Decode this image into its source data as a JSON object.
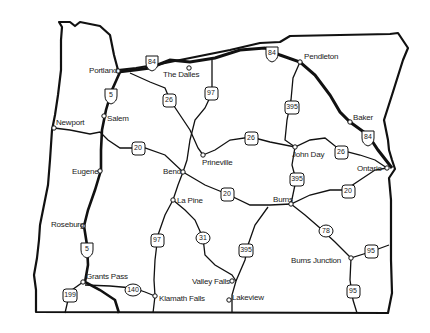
{
  "map": {
    "region": "Oregon",
    "cities": [
      {
        "name": "Portland",
        "x": 118,
        "y": 71
      },
      {
        "name": "The Dalles",
        "x": 189,
        "y": 68
      },
      {
        "name": "Pendleton",
        "x": 300,
        "y": 62
      },
      {
        "name": "Salem",
        "x": 104,
        "y": 116
      },
      {
        "name": "Newport",
        "x": 54,
        "y": 127
      },
      {
        "name": "Baker",
        "x": 350,
        "y": 122
      },
      {
        "name": "Prineville",
        "x": 203,
        "y": 155
      },
      {
        "name": "John Day",
        "x": 295,
        "y": 147
      },
      {
        "name": "Ontario",
        "x": 387,
        "y": 168
      },
      {
        "name": "Eugene",
        "x": 100,
        "y": 171
      },
      {
        "name": "Bend",
        "x": 183,
        "y": 172
      },
      {
        "name": "Burns",
        "x": 291,
        "y": 204
      },
      {
        "name": "La Pine",
        "x": 173,
        "y": 200
      },
      {
        "name": "Roseburg",
        "x": 83,
        "y": 226
      },
      {
        "name": "Burns Junction",
        "x": 351,
        "y": 258
      },
      {
        "name": "Valley Falls",
        "x": 232,
        "y": 281
      },
      {
        "name": "Grants Pass",
        "x": 83,
        "y": 282
      },
      {
        "name": "Klamath Falls",
        "x": 155,
        "y": 296
      },
      {
        "name": "Lakeview",
        "x": 229,
        "y": 300
      }
    ],
    "shields": [
      {
        "route": "84",
        "x": 152,
        "y": 62
      },
      {
        "route": "84",
        "x": 272,
        "y": 53
      },
      {
        "route": "84",
        "x": 368,
        "y": 137
      },
      {
        "route": "5",
        "x": 111,
        "y": 95
      },
      {
        "route": "5",
        "x": 87,
        "y": 249
      },
      {
        "route": "26",
        "x": 169,
        "y": 100
      },
      {
        "route": "97",
        "x": 211,
        "y": 93
      },
      {
        "route": "395",
        "x": 292,
        "y": 107
      },
      {
        "route": "26",
        "x": 251,
        "y": 138
      },
      {
        "route": "26",
        "x": 341,
        "y": 152
      },
      {
        "route": "20",
        "x": 138,
        "y": 148
      },
      {
        "route": "20",
        "x": 227,
        "y": 194
      },
      {
        "route": "20",
        "x": 348,
        "y": 191
      },
      {
        "route": "395",
        "x": 297,
        "y": 179
      },
      {
        "route": "78",
        "x": 326,
        "y": 231
      },
      {
        "route": "95",
        "x": 371,
        "y": 251
      },
      {
        "route": "95",
        "x": 353,
        "y": 291
      },
      {
        "route": "97",
        "x": 157,
        "y": 240
      },
      {
        "route": "31",
        "x": 203,
        "y": 238
      },
      {
        "route": "395",
        "x": 246,
        "y": 250
      },
      {
        "route": "140",
        "x": 133,
        "y": 290
      },
      {
        "route": "199",
        "x": 70,
        "y": 295
      }
    ]
  }
}
